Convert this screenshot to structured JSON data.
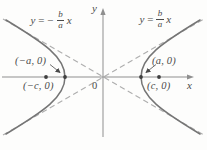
{
  "figure": {
    "type": "hyperbola-diagram",
    "colors": {
      "curve": "#757575",
      "asymptote": "#aeaeae",
      "axis": "#8f8f8f",
      "text": "#4a4a4a",
      "point": "#3f3f3f"
    },
    "asymptote_left_label": {
      "lhs": "y",
      "eq": "=",
      "sign": "−",
      "numerator": "b",
      "denominator": "a",
      "variable": "x"
    },
    "asymptote_right_label": {
      "lhs": "y",
      "eq": "=",
      "numerator": "b",
      "denominator": "a",
      "variable": "x"
    },
    "axis_labels": {
      "x": "x",
      "y": "y",
      "origin": "0"
    },
    "points": {
      "left_vertex": "(−a, 0)",
      "left_focus": "(−c, 0)",
      "right_vertex": "(a, 0)",
      "right_focus": "(c, 0)"
    }
  }
}
